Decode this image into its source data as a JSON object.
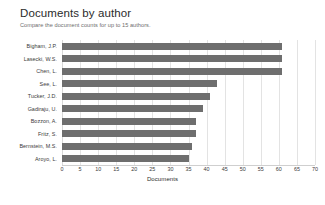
{
  "header": {
    "title": "Documents by author",
    "subtitle": "Compare the document counts for up to 15 authors."
  },
  "chart_data": {
    "type": "bar",
    "orientation": "horizontal",
    "title": "Documents by author",
    "xlabel": "Documents",
    "ylabel": "",
    "xlim": [
      0,
      70
    ],
    "xticks": [
      0,
      5,
      10,
      15,
      20,
      25,
      30,
      35,
      40,
      45,
      50,
      55,
      60,
      65,
      70
    ],
    "grid": true,
    "legend": "none",
    "bar_color": "#6e6e6e",
    "categories": [
      "Bigham, J.P.",
      "Lasecki, W.S.",
      "Chen, L.",
      "See, L.",
      "Tucker, J.D.",
      "Gadiraju, U.",
      "Bozzon, A.",
      "Fritz, S.",
      "Bernstein, M.S.",
      "Aroyo, L."
    ],
    "values": [
      61,
      61,
      61,
      43,
      41,
      39,
      37,
      37,
      36,
      35
    ]
  }
}
